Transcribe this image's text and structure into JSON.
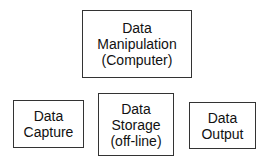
{
  "diagram": {
    "nodes": [
      {
        "id": "manipulation",
        "lines": [
          "Data",
          "Manipulation",
          "(Computer)"
        ]
      },
      {
        "id": "capture",
        "lines": [
          "Data",
          "Capture"
        ]
      },
      {
        "id": "storage",
        "lines": [
          "Data",
          "Storage",
          "(off-line)"
        ]
      },
      {
        "id": "output",
        "lines": [
          "Data",
          "Output"
        ]
      }
    ]
  }
}
